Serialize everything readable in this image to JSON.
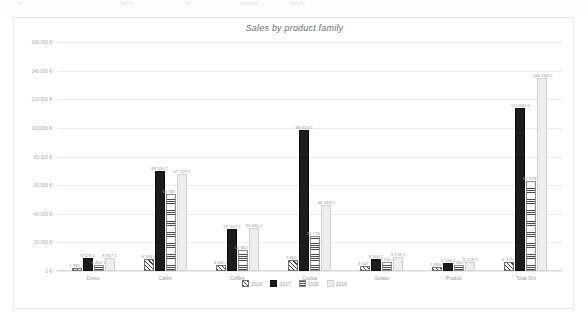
{
  "chart_data": {
    "type": "bar",
    "title": "Sales by product family",
    "xlabel": "",
    "ylabel": "",
    "ylim": [
      0,
      160000
    ],
    "grid": true,
    "legend_position": "bottom",
    "currency_suffix": "€",
    "ytick_labels": [
      "160 000 €",
      "140 000 €",
      "120 000 €",
      "100 000 €",
      "80 000 €",
      "60 000 €",
      "40 000 €",
      "20 000 €",
      "0 €"
    ],
    "ytick_values": [
      160000,
      140000,
      120000,
      100000,
      80000,
      60000,
      40000,
      20000,
      0
    ],
    "categories": [
      "Dress",
      "Cafés",
      "Coffee",
      "Cocoa",
      "Gelato",
      "Produit",
      "Total Gnl"
    ],
    "series": [
      {
        "name": "2016",
        "pattern": "diagonal-hatch",
        "values": [
          1881,
          8354,
          4430,
          7960,
          3647,
          2484,
          6271
        ],
        "labels": [
          "1 881 €",
          "8 354 €",
          "4 430 €",
          "7 960 €",
          "3 647 €",
          "2 484 €",
          "6 271 €"
        ]
      },
      {
        "name": "2017",
        "pattern": "dark-dotted",
        "values": [
          9129,
          69550,
          29520,
          98515,
          8400,
          5536,
          113842
        ],
        "labels": [
          "9 129 €",
          "69 550 €",
          "29 520 €",
          "98 515 €",
          "8 400 €",
          "5 536 €",
          "113 842 €"
        ]
      },
      {
        "name": "2018",
        "pattern": "horizontal-lines",
        "values": [
          4450,
          53587,
          14952,
          24175,
          6500,
          4340,
          62579
        ],
        "labels": [
          "4 450 €",
          "53 587 €",
          "14 952 €",
          "24 175 €",
          "6 500 €",
          "4 340 €",
          "62 579 €"
        ]
      },
      {
        "name": "2019",
        "pattern": "light-dotted",
        "values": [
          8917,
          67729,
          30066,
          46349,
          9718,
          6228,
          135158
        ],
        "labels": [
          "8 917 €",
          "67 729 €",
          "30 066 €",
          "46 349 €",
          "9 718 €",
          "6 228 €",
          "135 158 €"
        ]
      }
    ]
  },
  "legend": {
    "items": [
      {
        "label": "2016"
      },
      {
        "label": "2017"
      },
      {
        "label": "2018"
      },
      {
        "label": "2019"
      }
    ]
  },
  "colors": {
    "series_2016": "#3d3d3d",
    "series_2017": "#1c1c1c",
    "series_2018": "#4a4a4a",
    "series_2019": "#ededed",
    "gridline": "#ececf0",
    "card_border": "#e9eaee",
    "text": "#9b9ba1",
    "background": "#ffffff"
  },
  "ghost_top": {
    "fragments": [
      "A",
      "fx",
      "Sales",
      "by",
      "product",
      "family"
    ]
  }
}
